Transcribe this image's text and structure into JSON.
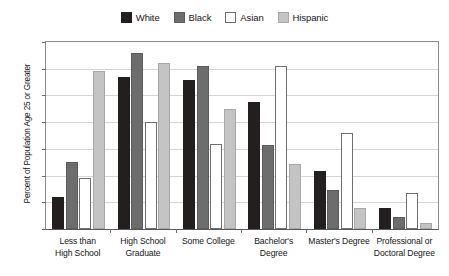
{
  "chart_data": {
    "type": "bar",
    "title": "",
    "xlabel": "",
    "ylabel": "Percent of Population Age 25 or Greater",
    "ylim": [
      0,
      35
    ],
    "yticks": [
      "0%",
      "5%",
      "10%",
      "15%",
      "20%",
      "25%",
      "30%",
      "35%"
    ],
    "ytick_values": [
      0,
      5,
      10,
      15,
      20,
      25,
      30,
      35
    ],
    "grid": true,
    "legend_position": "top-center",
    "categories": [
      "Less than High School",
      "High School Graduate",
      "Some College",
      "Bachelor's Degree",
      "Master's Degree",
      "Professional or Doctoral Degree"
    ],
    "category_lines": [
      [
        "Less than",
        "High School"
      ],
      [
        "High School",
        "Graduate"
      ],
      [
        "Some College",
        ""
      ],
      [
        "Bachelor's",
        "Degree"
      ],
      [
        "Master's Degree",
        ""
      ],
      [
        "Professional or",
        "Doctoral Degree"
      ]
    ],
    "series": [
      {
        "name": "White",
        "color": "#231f1f",
        "values": [
          6.0,
          28.5,
          27.8,
          23.8,
          10.8,
          4.0
        ]
      },
      {
        "name": "Black",
        "color": "#6d6d6d",
        "values": [
          12.5,
          33.0,
          30.5,
          15.7,
          7.3,
          2.2
        ]
      },
      {
        "name": "Asian",
        "color": "#ffffff",
        "values": [
          9.5,
          20.0,
          16.0,
          30.5,
          18.0,
          6.8
        ]
      },
      {
        "name": "Hispanic",
        "color": "#c4c4c4",
        "values": [
          29.5,
          31.0,
          22.5,
          12.2,
          4.0,
          1.2
        ]
      }
    ]
  },
  "legend": {
    "entries": [
      {
        "label": "White"
      },
      {
        "label": "Black"
      },
      {
        "label": "Asian"
      },
      {
        "label": "Hispanic"
      }
    ]
  }
}
